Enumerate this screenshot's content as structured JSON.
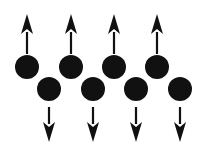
{
  "diagram": {
    "type": "antiferromagnetic-spin-chain",
    "colors": {
      "background": "#ffffff",
      "atom": "#111111",
      "arrow": "#111111"
    },
    "atom_radius": 12,
    "spins": [
      {
        "x": 27,
        "y": 67,
        "direction": "up"
      },
      {
        "x": 49,
        "y": 89,
        "direction": "down"
      },
      {
        "x": 71,
        "y": 67,
        "direction": "up"
      },
      {
        "x": 93,
        "y": 89,
        "direction": "down"
      },
      {
        "x": 114,
        "y": 67,
        "direction": "up"
      },
      {
        "x": 136,
        "y": 89,
        "direction": "down"
      },
      {
        "x": 157,
        "y": 67,
        "direction": "up"
      },
      {
        "x": 180,
        "y": 89,
        "direction": "down"
      }
    ]
  }
}
